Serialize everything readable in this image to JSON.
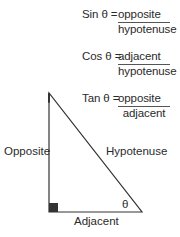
{
  "formulas": [
    {
      "function": "Sin",
      "angle": "θ",
      "equals": "=",
      "lhs": "Sin θ =",
      "numerator": "opposite",
      "denominator": "hypotenuse"
    },
    {
      "function": "Cos",
      "angle": "θ",
      "equals": "=",
      "lhs": "Cos θ =",
      "numerator": "adjacent",
      "denominator": "hypotenuse"
    },
    {
      "function": "Tan",
      "angle": "θ",
      "equals": "=",
      "lhs": "Tan θ =",
      "numerator": "opposite",
      "denominator": "adjacent"
    }
  ],
  "triangle": {
    "labels": {
      "opposite": "Opposite",
      "hypotenuse": "Hypotenuse",
      "adjacent": "Adjacent",
      "angle": "θ"
    },
    "colors": {
      "line": "#333333",
      "right_angle_marker": "#333333"
    }
  }
}
